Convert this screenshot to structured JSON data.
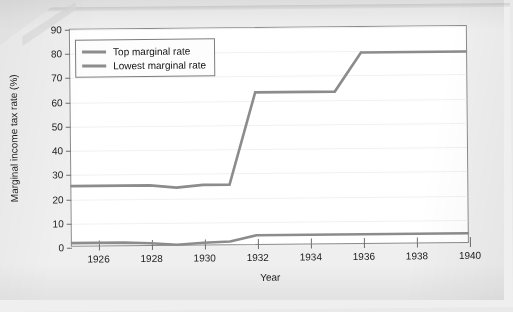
{
  "figure": {
    "background_color": "#e9e9e9",
    "page_color": "#efefef",
    "plot_background": "#ffffff",
    "line_color": "#8c8c8c",
    "axis_color": "#8a8a8a"
  },
  "legend": {
    "position": "top-left-inside",
    "entries": [
      {
        "label": "Top marginal rate",
        "color": "#8c8c8c"
      },
      {
        "label": "Lowest marginal rate",
        "color": "#8c8c8c"
      }
    ]
  },
  "chart_data": {
    "type": "line",
    "title": "",
    "subtitle": "",
    "xlabel": "Year",
    "ylabel": "Marginal income tax rate (%)",
    "xlim": [
      1925,
      1940
    ],
    "ylim": [
      0,
      90
    ],
    "xticks": [
      1926,
      1928,
      1930,
      1932,
      1934,
      1936,
      1938,
      1940
    ],
    "xticklabels": [
      "1926",
      "1928",
      "1930",
      "1932",
      "1934",
      "1936",
      "1938",
      "1940"
    ],
    "yticks": [
      0,
      10,
      20,
      30,
      40,
      50,
      60,
      70,
      80,
      90
    ],
    "yticklabels": [
      "0",
      "10",
      "20",
      "30",
      "40",
      "50",
      "60",
      "70",
      "80",
      "90"
    ],
    "grid": "horizontal-faint",
    "legend_position": "upper left",
    "x": [
      1925,
      1926,
      1927,
      1928,
      1929,
      1930,
      1931,
      1932,
      1933,
      1934,
      1935,
      1936,
      1937,
      1938,
      1939,
      1940
    ],
    "series": [
      {
        "name": "Top marginal rate",
        "color": "#8c8c8c",
        "values": [
          25,
          25,
          25,
          25,
          24,
          25,
          25,
          63,
          63,
          63,
          63,
          79,
          79,
          79,
          79,
          79
        ]
      },
      {
        "name": "Lowest marginal rate",
        "color": "#8c8c8c",
        "values": [
          1.5,
          1.5,
          1.5,
          1.125,
          0.375,
          1.125,
          1.5,
          4,
          4,
          4,
          4,
          4,
          4,
          4,
          4,
          4
        ]
      }
    ],
    "annotations": []
  }
}
